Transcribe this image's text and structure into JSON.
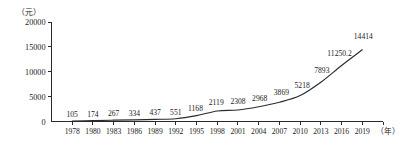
{
  "chart_data": {
    "type": "line",
    "title": "",
    "subtitle": "",
    "xlabel": "（年）",
    "ylabel": "（元）",
    "y_unit_label": "（元）",
    "x_unit_label": "（年）",
    "categories": [
      "1978",
      "1980",
      "1983",
      "1986",
      "1989",
      "1992",
      "1995",
      "1998",
      "2001",
      "2004",
      "2007",
      "2010",
      "2013",
      "2016",
      "2019"
    ],
    "values": [
      105,
      174,
      267,
      334,
      437,
      551,
      1168,
      2119,
      2308,
      2968,
      3869,
      5218,
      7893,
      11250.2,
      14414
    ],
    "point_labels": [
      "105",
      "174",
      "267",
      "334",
      "437",
      "551",
      "1168",
      "2119",
      "2308",
      "2968",
      "3869",
      "5218",
      "7893",
      "11250.2",
      "14414"
    ],
    "ytick_labels": [
      "0",
      "5000",
      "10000",
      "15000",
      "20000"
    ],
    "ytick_values": [
      0,
      5000,
      10000,
      15000,
      20000
    ],
    "ylim": [
      0,
      20000
    ],
    "grid": false,
    "legend": null,
    "legend_position": "none",
    "series_color": "#2b2b2b",
    "axis_color": "#2b2b2b",
    "background_color": "#ffffff"
  }
}
